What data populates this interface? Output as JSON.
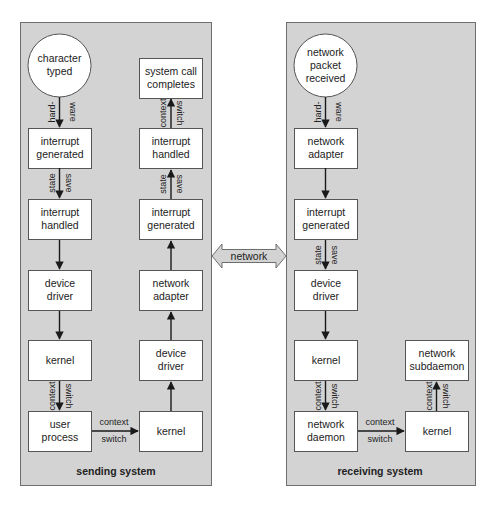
{
  "diagram": {
    "sending_system": {
      "label": "sending system",
      "nodes": {
        "character_typed": [
          "character",
          "typed"
        ],
        "interrupt_generated": [
          "interrupt",
          "generated"
        ],
        "interrupt_handled": [
          "interrupt",
          "handled"
        ],
        "device_driver": [
          "device",
          "driver"
        ],
        "kernel_1": [
          "kernel"
        ],
        "user_process": [
          "user",
          "process"
        ],
        "kernel_2": [
          "kernel"
        ],
        "device_driver_2": [
          "device",
          "driver"
        ],
        "network_adapter": [
          "network",
          "adapter"
        ],
        "interrupt_generated_2": [
          "interrupt",
          "generated"
        ],
        "interrupt_handled_2": [
          "interrupt",
          "handled"
        ],
        "system_call_completes": [
          "system call",
          "completes"
        ]
      },
      "edges": {
        "hardware": [
          "hard-",
          "ware"
        ],
        "state_save_1": [
          "state",
          "save"
        ],
        "context_switch_1": [
          "context",
          "switch"
        ],
        "context_switch_2": [
          "context",
          "switch"
        ],
        "state_save_2": [
          "state",
          "save"
        ],
        "context_switch_3": [
          "context",
          "switch"
        ]
      }
    },
    "network": {
      "label": "network"
    },
    "receiving_system": {
      "label": "receiving system",
      "nodes": {
        "network_packet_received": [
          "network",
          "packet",
          "received"
        ],
        "network_adapter": [
          "network",
          "adapter"
        ],
        "interrupt_generated": [
          "interrupt",
          "generated"
        ],
        "device_driver": [
          "device",
          "driver"
        ],
        "kernel_1": [
          "kernel"
        ],
        "network_daemon": [
          "network",
          "daemon"
        ],
        "kernel_2": [
          "kernel"
        ],
        "network_subdaemon": [
          "network",
          "subdaemon"
        ]
      },
      "edges": {
        "hardware": [
          "hard-",
          "ware"
        ],
        "state_save": [
          "state",
          "save"
        ],
        "context_switch_1": [
          "context",
          "switch"
        ],
        "context_switch_2": [
          "context",
          "switch"
        ],
        "context_switch_3": [
          "context",
          "switch"
        ]
      }
    },
    "colors": {
      "panel_fill": "#d3d3d3",
      "panel_border": "#6e6e6e",
      "box_fill": "#ffffff",
      "line": "#1a1a1a"
    }
  }
}
